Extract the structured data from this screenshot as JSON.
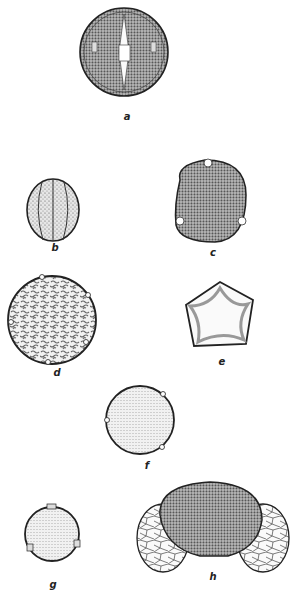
{
  "figure": {
    "panels": [
      {
        "id": "a",
        "label": "a",
        "shape": "spheroidal, furrowed with central pore, reticulate texture"
      },
      {
        "id": "b",
        "label": "b",
        "shape": "ellipsoidal, multi-colpate"
      },
      {
        "id": "c",
        "label": "c",
        "shape": "rounded-triangular, triporate, granular"
      },
      {
        "id": "d",
        "label": "d",
        "shape": "spheroidal, periporate, vermiculate pattern"
      },
      {
        "id": "e",
        "label": "e",
        "shape": "pentagonal, pentaporate with arci"
      },
      {
        "id": "f",
        "label": "f",
        "shape": "spheroidal, triporate, finely granular"
      },
      {
        "id": "g",
        "label": "g",
        "shape": "spheroidal, triporate, small"
      },
      {
        "id": "h",
        "label": "h",
        "shape": "bisaccate, reticulate air sacs"
      }
    ],
    "colors": {
      "ink": "#222222",
      "stipple": "#8a8a8a",
      "background": "#ffffff"
    }
  }
}
